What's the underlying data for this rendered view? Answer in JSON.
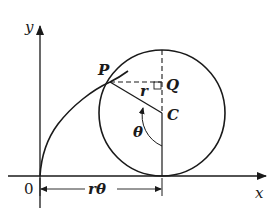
{
  "diagram": {
    "labels": {
      "y_axis": "y",
      "x_axis": "x",
      "origin": "0",
      "point_p": "P",
      "point_q": "Q",
      "point_c": "C",
      "radius": "r",
      "angle": "θ",
      "arc_length": "rθ"
    },
    "colors": {
      "stroke": "#1a1a1a",
      "background": "#ffffff"
    },
    "geometry": {
      "origin": [
        40,
        176
      ],
      "circle_center": [
        162,
        113
      ],
      "circle_radius": 63,
      "point_p": [
        110,
        82
      ],
      "point_q": [
        162,
        82
      ]
    }
  }
}
